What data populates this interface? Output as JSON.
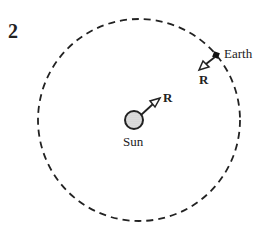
{
  "figure": {
    "number": "2",
    "labels": {
      "earth": "Earth",
      "sun": "Sun",
      "force_on_earth": "R",
      "force_on_sun": "R"
    },
    "colors": {
      "stroke": "#222222",
      "sun_fill": "#d0d0d0",
      "background": "#ffffff"
    }
  }
}
